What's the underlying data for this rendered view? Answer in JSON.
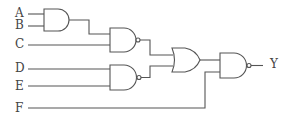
{
  "diagram": {
    "type": "logic-circuit",
    "inputs": [
      "A",
      "B",
      "C",
      "D",
      "E",
      "F"
    ],
    "output": "Y",
    "gates": [
      {
        "id": "g1",
        "type": "AND",
        "inputs": [
          "A",
          "B"
        ]
      },
      {
        "id": "g2",
        "type": "NAND",
        "inputs": [
          "g1",
          "C"
        ]
      },
      {
        "id": "g3",
        "type": "NAND",
        "inputs": [
          "D",
          "E"
        ]
      },
      {
        "id": "g4",
        "type": "OR",
        "inputs": [
          "g2",
          "g3"
        ]
      },
      {
        "id": "g5",
        "type": "NAND",
        "inputs": [
          "g4",
          "F"
        ],
        "output": "Y"
      }
    ]
  },
  "labels": {
    "a": "A",
    "b": "B",
    "c": "C",
    "d": "D",
    "e": "E",
    "f": "F",
    "y": "Y"
  }
}
